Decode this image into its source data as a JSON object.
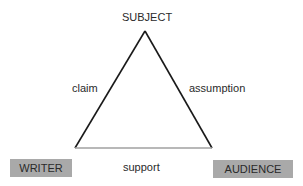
{
  "diagram": {
    "nodes": {
      "top": "SUBJECT",
      "bottom_left": "WRITER",
      "bottom_right": "AUDIENCE"
    },
    "edges": {
      "left": "claim",
      "right": "assumption",
      "bottom": "support"
    },
    "colors": {
      "box_fill": "#a9a9a9",
      "side_lines": "#1a1a1a",
      "base_line": "#a0a0a0"
    }
  }
}
